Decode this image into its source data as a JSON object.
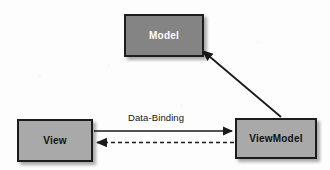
{
  "diagram": {
    "background_color": "#fdfdfd",
    "nodes": [
      {
        "id": "model",
        "label": "Model",
        "fill": "#848484",
        "text_color": "#ffffff",
        "border_color": "#1c1c1c"
      },
      {
        "id": "view",
        "label": "View",
        "fill": "#a9a9a9",
        "text_color": "#111111",
        "border_color": "#1c1c1c"
      },
      {
        "id": "viewmodel",
        "label": "ViewModel",
        "fill": "#a9a9a9",
        "text_color": "#111111",
        "border_color": "#1c1c1c"
      }
    ],
    "edges": [
      {
        "id": "view-to-viewmodel",
        "from": "view",
        "to": "viewmodel",
        "style": "solid",
        "arrow": "end",
        "label": "Data-Binding",
        "color": "#1a1a1a"
      },
      {
        "id": "viewmodel-to-view",
        "from": "viewmodel",
        "to": "view",
        "style": "dashed",
        "arrow": "end",
        "label": "",
        "color": "#1a1a1a"
      },
      {
        "id": "viewmodel-to-model",
        "from": "viewmodel",
        "to": "model",
        "style": "solid",
        "arrow": "end",
        "label": "",
        "color": "#1a1a1a"
      }
    ]
  }
}
